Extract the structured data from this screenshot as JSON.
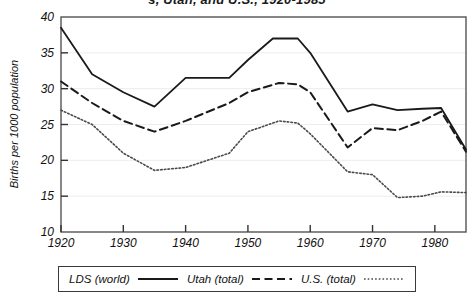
{
  "chart": {
    "title": "s, Utah, and U.S., 1920-1985",
    "title_note": "clipped-at-top-edge",
    "ylabel": "Births per 1000 population",
    "xlabel": "",
    "yticks": [
      10,
      15,
      20,
      25,
      30,
      35,
      40
    ],
    "xticks": [
      1920,
      1930,
      1940,
      1950,
      1960,
      1970,
      1980
    ]
  },
  "legend": {
    "items": [
      {
        "label": "LDS (world)",
        "style": "solid"
      },
      {
        "label": "Utah (total)",
        "style": "dashed"
      },
      {
        "label": "U.S. (total)",
        "style": "dotted"
      }
    ]
  },
  "chart_data": {
    "type": "line",
    "title": "s, Utah, and U.S., 1920-1985",
    "xlabel": "",
    "ylabel": "Births per 1000 population",
    "xlim": [
      1920,
      1985
    ],
    "ylim": [
      10,
      40
    ],
    "grid": true,
    "legend_position": "bottom",
    "series": [
      {
        "name": "LDS (world)",
        "style": "solid",
        "color": "#1a1a1a",
        "x": [
          1920,
          1925,
          1930,
          1935,
          1940,
          1947,
          1950,
          1954,
          1958,
          1960,
          1966,
          1970,
          1974,
          1978,
          1981,
          1985
        ],
        "values": [
          38.5,
          32.0,
          29.5,
          27.5,
          31.5,
          31.5,
          34.0,
          37.0,
          37.0,
          35.0,
          26.8,
          27.8,
          27.0,
          27.2,
          27.3,
          21.5
        ]
      },
      {
        "name": "Utah (total)",
        "style": "dashed",
        "color": "#1a1a1a",
        "x": [
          1920,
          1925,
          1930,
          1935,
          1940,
          1947,
          1950,
          1955,
          1958,
          1960,
          1966,
          1970,
          1974,
          1978,
          1981,
          1985
        ],
        "values": [
          31.0,
          28.0,
          25.5,
          24.0,
          25.5,
          28.0,
          29.5,
          30.8,
          30.6,
          29.5,
          21.8,
          24.5,
          24.2,
          25.5,
          26.8,
          21.2
        ]
      },
      {
        "name": "U.S. (total)",
        "style": "dotted",
        "color": "#4a4a4a",
        "x": [
          1920,
          1925,
          1930,
          1935,
          1940,
          1947,
          1950,
          1955,
          1958,
          1960,
          1966,
          1970,
          1974,
          1978,
          1981,
          1985
        ],
        "values": [
          27.0,
          25.0,
          21.0,
          18.6,
          19.0,
          21.0,
          24.0,
          25.5,
          25.2,
          23.7,
          18.4,
          18.0,
          14.8,
          15.0,
          15.6,
          15.5
        ]
      }
    ]
  }
}
